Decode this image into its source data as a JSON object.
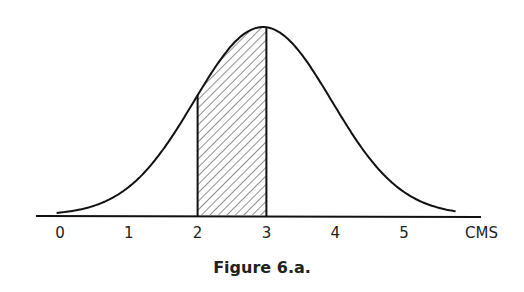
{
  "chart_data": {
    "type": "area",
    "title": "",
    "caption": "Figure 6.a.",
    "xlabel": "CMS",
    "ylabel": "",
    "x_ticks": [
      "0",
      "1",
      "2",
      "3",
      "4",
      "5"
    ],
    "xlim": [
      -0.35,
      6.1
    ],
    "grid": false,
    "legend": null,
    "curve": {
      "kind": "normal",
      "mean": 2.95,
      "sd": 1.0,
      "x_start": -0.05,
      "x_end": 5.75
    },
    "shaded_region": {
      "from": 2,
      "to": 3,
      "pattern": "diagonal-hatch"
    }
  },
  "figure": {
    "caption": "Figure 6.a.",
    "axis_unit_label": "CMS",
    "tick_labels": [
      "0",
      "1",
      "2",
      "3",
      "4",
      "5"
    ]
  }
}
